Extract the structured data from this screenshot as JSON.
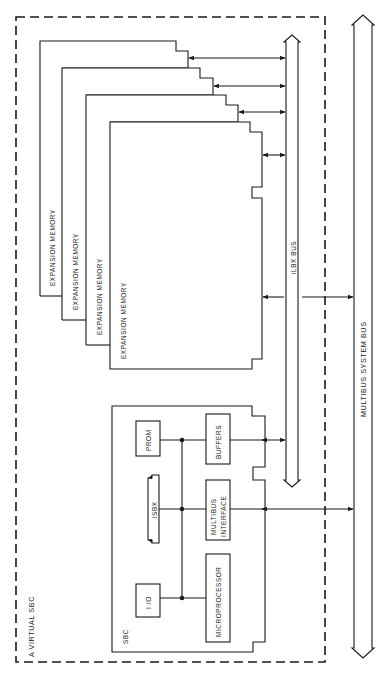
{
  "diagram": {
    "title": "A VIRTUAL SBC",
    "colors": {
      "line": "#1a1a1a",
      "background": "#ffffff"
    },
    "enclosure": {
      "label": "A VIRTUAL SBC",
      "style": "dashed"
    },
    "buses": [
      {
        "id": "ilbx",
        "label": "iLBX BUS"
      },
      {
        "id": "multibus",
        "label": "MULTIBUS SYSTEM BUS"
      }
    ],
    "memory_boards": [
      {
        "label": "EXPANSION MEMORY"
      },
      {
        "label": "EXPANSION MEMORY"
      },
      {
        "label": "EXPANSION MEMORY"
      },
      {
        "label": "EXPANSION MEMORY"
      }
    ],
    "sbc": {
      "label": "SBC",
      "components": {
        "prom": "PROM",
        "isbx": "iSBX",
        "io": "I /O",
        "buffers": "BUFFERS",
        "multibus_interface_line1": "MULTIBUS",
        "multibus_interface_line2": "INTERFACE",
        "microprocessor": "MICROPROCESSOR"
      }
    },
    "connections": [
      {
        "from": "memory-board-1",
        "to": "ilbx",
        "type": "bidirectional"
      },
      {
        "from": "memory-board-2",
        "to": "ilbx",
        "type": "bidirectional"
      },
      {
        "from": "memory-board-3",
        "to": "ilbx",
        "type": "bidirectional"
      },
      {
        "from": "memory-board-4",
        "to": "ilbx",
        "type": "bidirectional"
      },
      {
        "from": "memory-board-4",
        "to": "multibus",
        "type": "bidirectional"
      },
      {
        "from": "buffers",
        "to": "ilbx",
        "type": "bidirectional"
      },
      {
        "from": "multibus-interface",
        "to": "multibus",
        "type": "bidirectional"
      }
    ]
  }
}
